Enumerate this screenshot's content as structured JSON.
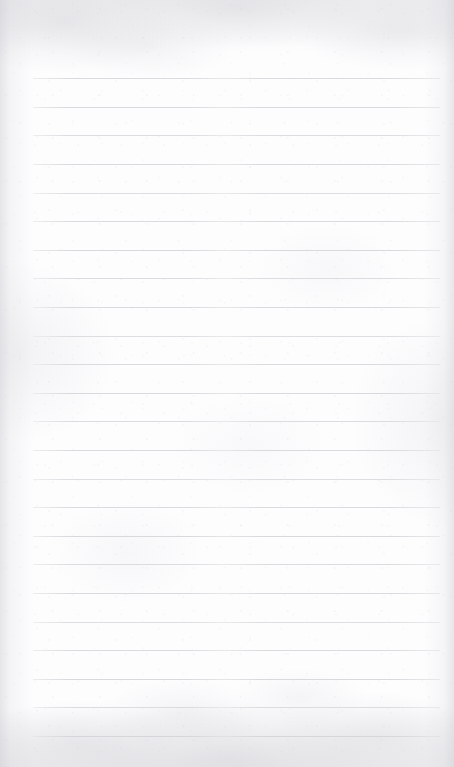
{
  "document": {
    "kind": "lined-paper-scan",
    "title": "Blank ruled notebook page",
    "text_content": "",
    "handwriting": "none",
    "page_width": 454,
    "page_height": 767
  },
  "paper": {
    "background_color": "#fdfdfe",
    "edge_tint_color": "#c5c5cc",
    "texture": "mottled scan grain",
    "orientation": "portrait"
  },
  "ruling": {
    "line_color": "#d7d7dc",
    "line_thickness_px": 1,
    "line_spacing_px": 28.6,
    "first_line_y": 78,
    "line_left_x": 33,
    "line_right_x": 440,
    "line_count": 24,
    "margin_rule": "none",
    "lines": [
      {
        "index": 1,
        "y": 78,
        "x1": 33,
        "x2": 440
      },
      {
        "index": 2,
        "y": 107,
        "x1": 33,
        "x2": 440
      },
      {
        "index": 3,
        "y": 135,
        "x1": 33,
        "x2": 440
      },
      {
        "index": 4,
        "y": 164,
        "x1": 33,
        "x2": 440
      },
      {
        "index": 5,
        "y": 193,
        "x1": 33,
        "x2": 440
      },
      {
        "index": 6,
        "y": 221,
        "x1": 33,
        "x2": 440
      },
      {
        "index": 7,
        "y": 250,
        "x1": 33,
        "x2": 440
      },
      {
        "index": 8,
        "y": 278,
        "x1": 33,
        "x2": 440
      },
      {
        "index": 9,
        "y": 307,
        "x1": 33,
        "x2": 440
      },
      {
        "index": 10,
        "y": 336,
        "x1": 33,
        "x2": 440
      },
      {
        "index": 11,
        "y": 364,
        "x1": 33,
        "x2": 440
      },
      {
        "index": 12,
        "y": 393,
        "x1": 33,
        "x2": 440
      },
      {
        "index": 13,
        "y": 421,
        "x1": 33,
        "x2": 440
      },
      {
        "index": 14,
        "y": 450,
        "x1": 33,
        "x2": 440
      },
      {
        "index": 15,
        "y": 479,
        "x1": 33,
        "x2": 440
      },
      {
        "index": 16,
        "y": 507,
        "x1": 33,
        "x2": 440
      },
      {
        "index": 17,
        "y": 536,
        "x1": 33,
        "x2": 440
      },
      {
        "index": 18,
        "y": 564,
        "x1": 33,
        "x2": 440
      },
      {
        "index": 19,
        "y": 593,
        "x1": 33,
        "x2": 440
      },
      {
        "index": 20,
        "y": 622,
        "x1": 33,
        "x2": 440
      },
      {
        "index": 21,
        "y": 650,
        "x1": 33,
        "x2": 440
      },
      {
        "index": 22,
        "y": 679,
        "x1": 33,
        "x2": 440
      },
      {
        "index": 23,
        "y": 707,
        "x1": 33,
        "x2": 440
      },
      {
        "index": 24,
        "y": 736,
        "x1": 33,
        "x2": 440
      }
    ]
  }
}
